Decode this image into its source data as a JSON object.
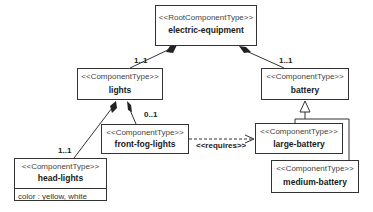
{
  "diagram": {
    "type": "UML component feature model",
    "nodes": [
      {
        "id": "electric-equipment",
        "stereotype": "<<RootComponentType>>",
        "name": "electric-equipment"
      },
      {
        "id": "lights",
        "stereotype": "<<ComponentType>>",
        "name": "lights"
      },
      {
        "id": "battery",
        "stereotype": "<<ComponentType>>",
        "name": "battery"
      },
      {
        "id": "front-fog-lights",
        "stereotype": "<<ComponentType>>",
        "name": "front-fog-lights"
      },
      {
        "id": "large-battery",
        "stereotype": "<<ComponentType>>",
        "name": "large-battery"
      },
      {
        "id": "medium-battery",
        "stereotype": "<<ComponentType>>",
        "name": "medium-battery"
      },
      {
        "id": "head-lights",
        "stereotype": "<<ComponentType>>",
        "name": "head-lights",
        "attributes": [
          "color : yellow, white"
        ]
      }
    ],
    "edges": [
      {
        "from": "electric-equipment",
        "to": "lights",
        "kind": "composition",
        "multiplicity": "1..1"
      },
      {
        "from": "electric-equipment",
        "to": "battery",
        "kind": "composition",
        "multiplicity": "1..1"
      },
      {
        "from": "lights",
        "to": "head-lights",
        "kind": "composition",
        "multiplicity": "1..1"
      },
      {
        "from": "lights",
        "to": "front-fog-lights",
        "kind": "composition",
        "multiplicity": "0..1"
      },
      {
        "from": "large-battery",
        "to": "battery",
        "kind": "generalization"
      },
      {
        "from": "medium-battery",
        "to": "battery",
        "kind": "generalization"
      },
      {
        "from": "front-fog-lights",
        "to": "large-battery",
        "kind": "dependency",
        "label": "<<requires>>"
      }
    ]
  },
  "labels": {
    "mult_lights": "1..1",
    "mult_battery": "1..1",
    "mult_head_lights": "1..1",
    "mult_front_fog": "0..1",
    "requires": "<<requires>>"
  },
  "colors": {
    "line": "#333333",
    "background": "#ffffff"
  }
}
